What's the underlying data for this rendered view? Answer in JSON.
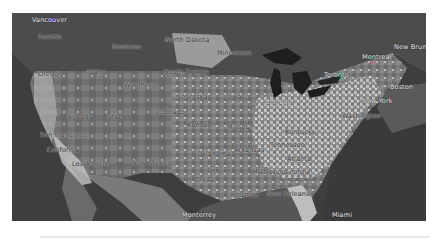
{
  "map": {
    "type": "choropleth-over-satellite",
    "region": "Contiguous United States",
    "colors": {
      "ocean": "#3a3a3a",
      "ocean_light": "#5a5a5a",
      "land_low": "#6e6e6e",
      "land_mid": "#8c8c8c",
      "land_high": "#d8d8d8",
      "canada": "#4a4a4a",
      "lakes": "#1e1e1e"
    },
    "labels": {
      "vancouver": "Vancouver",
      "seattle": "Seattle",
      "montana": "Montana",
      "north_dakota": "North Dakota",
      "oregon": "Oregon",
      "idaho": "Idaho",
      "south_dakota": "South Dakota",
      "wyoming": "Wyoming",
      "nebraska": "Nebraska",
      "nevada": "Nevada",
      "utah": "Utah",
      "colorado": "Colorado",
      "kansas": "Kansas",
      "san_francisco": "San Francisco",
      "california": "California",
      "los_angeles": "Los Angeles",
      "new_mexico": "New Mexico",
      "oklahoma": "Oklahoma",
      "dallas": "Dallas",
      "texas": "Texas",
      "houston": "Houston",
      "monterrey": "Monterrey",
      "chicago": "Chicago",
      "toronto": "Toronto",
      "montreal": "Montreal",
      "new_brunswick": "New Brunswick",
      "boston": "Boston",
      "new_york": "New York",
      "washington": "Washington",
      "kentucky": "Kentucky",
      "tennessee": "Tennessee",
      "georgia": "Georgia",
      "atlanta": "Atlanta",
      "new_orleans": "New Orleans",
      "miami": "Miami",
      "missouri": "Missouri",
      "iowa": "Iowa",
      "minnesota": "Minnesota",
      "arkansas": "Arkansas",
      "mississippi": "Mississippi"
    }
  }
}
